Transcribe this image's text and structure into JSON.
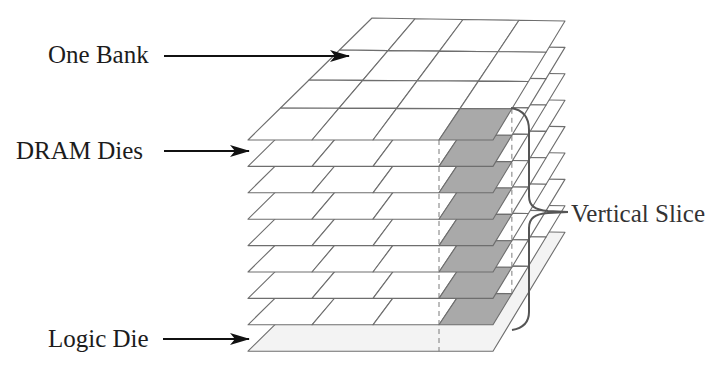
{
  "diagram": {
    "labels": {
      "one_bank": "One Bank",
      "dram_dies": "DRAM Dies",
      "logic_die": "Logic Die",
      "vertical_slice": "Vertical Slice"
    },
    "structure": {
      "layers_total": 9,
      "dram_die_count": 8,
      "logic_die_count": 1,
      "grid_rows": 4,
      "grid_cols": 4,
      "highlighted_bank": {
        "row": 3,
        "col": 3,
        "description": "front-right bank on each DRAM die"
      }
    },
    "colors": {
      "grid_line": "#6e6e6e",
      "bank_fill": "#ffffff",
      "highlight_fill": "#a9a9a9",
      "logic_die_fill": "#f3f3f3",
      "arrow": "#111111",
      "brace": "#555555",
      "dashed_line": "#7a7a7a"
    }
  }
}
